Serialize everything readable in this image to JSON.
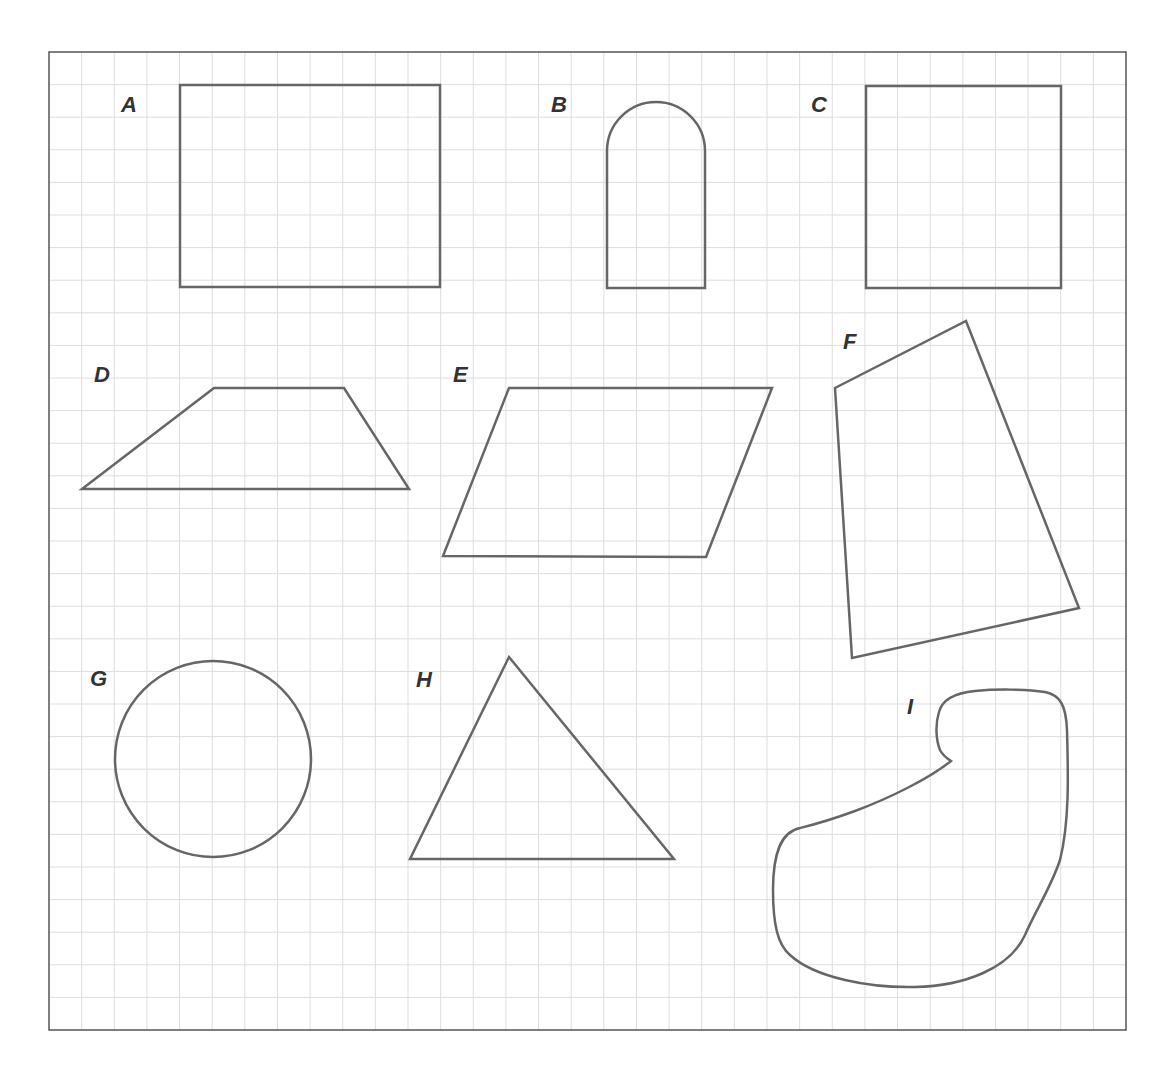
{
  "figure": {
    "frame": {
      "x": 49,
      "y": 52,
      "width": 1077,
      "height": 978
    },
    "grid": {
      "columns": 33,
      "rows": 30,
      "line_color": "#dddddd"
    },
    "stroke_color": "#666666",
    "label_color": "#333333"
  },
  "shapes": [
    {
      "label": "A",
      "kind": "rectangle",
      "label_pos": [
        121,
        112
      ]
    },
    {
      "label": "B",
      "kind": "arch",
      "label_pos": [
        551,
        112
      ]
    },
    {
      "label": "C",
      "kind": "square",
      "label_pos": [
        811,
        112
      ]
    },
    {
      "label": "D",
      "kind": "trapezoid",
      "label_pos": [
        94,
        382
      ]
    },
    {
      "label": "E",
      "kind": "parallelogram",
      "label_pos": [
        453,
        382
      ]
    },
    {
      "label": "F",
      "kind": "quadrilateral",
      "label_pos": [
        843,
        349
      ]
    },
    {
      "label": "G",
      "kind": "circle",
      "label_pos": [
        90,
        686
      ]
    },
    {
      "label": "H",
      "kind": "triangle",
      "label_pos": [
        416,
        687
      ]
    },
    {
      "label": "I",
      "kind": "irregular-closed-curve",
      "label_pos": [
        907,
        714
      ]
    }
  ]
}
